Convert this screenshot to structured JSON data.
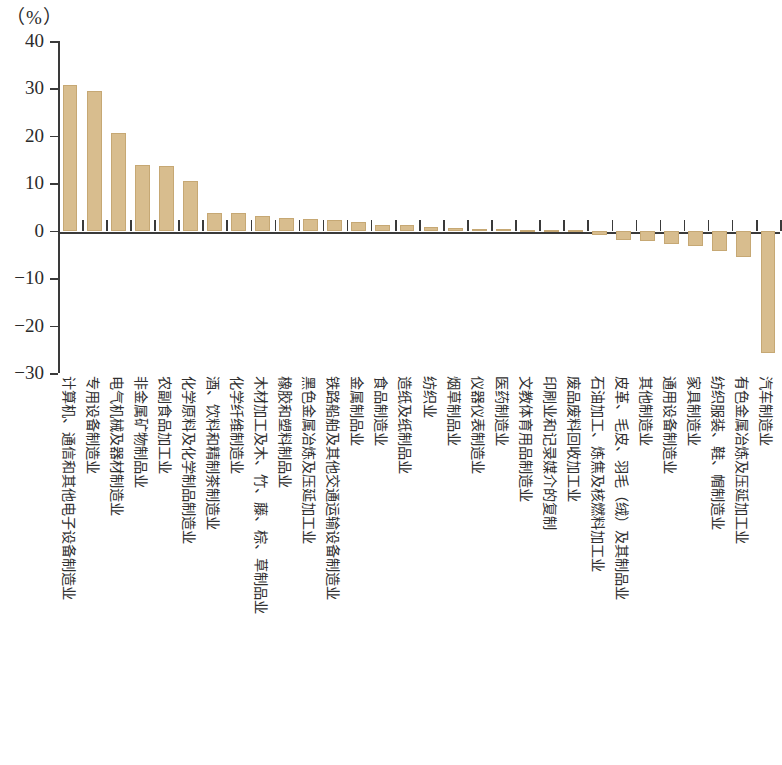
{
  "chart_data": {
    "type": "bar",
    "title": "",
    "subtitle": "",
    "unit_label": "（%）",
    "xlabel": "",
    "ylabel": "",
    "ylim": [
      -30,
      40
    ],
    "yticks": [
      40,
      30,
      20,
      10,
      0,
      -10,
      -20,
      -30
    ],
    "ytick_labels": [
      "40",
      "30",
      "20",
      "10",
      "0",
      "−10",
      "−20",
      "−30"
    ],
    "grid": false,
    "legend": null,
    "bar_color": "#d8bd8e",
    "bar_edge_color": "#c6a874",
    "axis_color": "#3a3a3a",
    "categories": [
      "计算机、通信和其他电子设备制造业",
      "专用设备制造业",
      "电气机械及器材制造业",
      "非金属矿物制品业",
      "农副食品加工业",
      "化学原料及化学制品制造业",
      "酒、饮料和精制茶制造业",
      "化学纤维制造业",
      "木材加工及木、竹、藤、棕、草制品业",
      "橡胶和塑料制品业",
      "黑色金属冶炼及压延加工业",
      "铁路船舶及其他交通运输设备制造业",
      "金属制品业",
      "食品制造业",
      "造纸及纸制品业",
      "纺织业",
      "烟草制品业",
      "仪器仪表制造业",
      "医药制造业",
      "文教体育用品制造业",
      "印刷业和记录媒介的复制",
      "废品废料回收加工业",
      "石油加工、炼焦及核燃料加工业",
      "皮革、毛皮、羽毛（绒）及其制品业",
      "其他制造业",
      "通用设备制造业",
      "家具制造业",
      "纺织服装、鞋、帽制造业",
      "有色金属冶炼及压延加工业",
      "汽车制造业"
    ],
    "values": [
      30.8,
      29.5,
      20.6,
      13.9,
      13.6,
      10.4,
      3.8,
      3.7,
      3.0,
      2.7,
      2.4,
      2.3,
      1.8,
      1.1,
      1.1,
      0.7,
      0.5,
      0.3,
      0.3,
      0.2,
      0.2,
      0.15,
      -0.9,
      -1.9,
      -2.2,
      -2.9,
      -3.3,
      -4.2,
      -5.6,
      -25.8
    ]
  }
}
